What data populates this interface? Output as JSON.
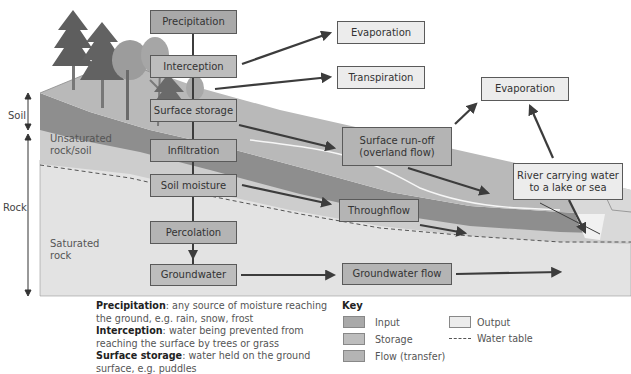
{
  "diagram": {
    "title_hidden": "Drainage basin hydrological cycle",
    "side_scale": {
      "soil_label": "Soil",
      "rock_label": "Rock"
    },
    "layer_labels": {
      "unsaturated": [
        "Unsaturated",
        "rock/soil"
      ],
      "saturated": [
        "Saturated",
        "rock"
      ]
    },
    "stores_and_flows": {
      "precipitation": "Precipitation",
      "interception": "Interception",
      "surface_storage": "Surface storage",
      "infiltration": "Infiltration",
      "soil_moisture": "Soil moisture",
      "percolation": "Percolation",
      "groundwater": "Groundwater",
      "surface_runoff_line1": "Surface run-off",
      "surface_runoff_line2": "(overland flow)",
      "throughflow": "Throughflow",
      "groundwater_flow": "Groundwater flow"
    },
    "outputs": {
      "evaporation_1": "Evaporation",
      "transpiration": "Transpiration",
      "evaporation_2": "Evaporation",
      "river_line1": "River carrying water",
      "river_line2": "to a lake or sea"
    },
    "colors": {
      "input": "#a9a9a9",
      "storage": "#bdbdbd",
      "flow": "#b4b4b4",
      "output": "#ececec",
      "soil_layer": "#8f8f8f",
      "surface_layer": "#b9b9b9",
      "rock_unsaturated": "#cfcfcf",
      "rock_saturated": "#e2e2e2",
      "arrow": "#3c3c3c"
    }
  },
  "definitions": [
    {
      "term": "Precipitation",
      "text": ": any source of moisture reaching the ground, e.g. rain, snow, frost"
    },
    {
      "term": "Interception",
      "text": ": water being prevented from reaching the surface by trees or grass"
    },
    {
      "term": "Surface storage",
      "text": ": water held on the ground surface, e.g. puddles"
    }
  ],
  "key": {
    "title": "Key",
    "items": {
      "input": "Input",
      "storage": "Storage",
      "flow": "Flow (transfer)",
      "output": "Output",
      "water_table": "Water table"
    }
  }
}
